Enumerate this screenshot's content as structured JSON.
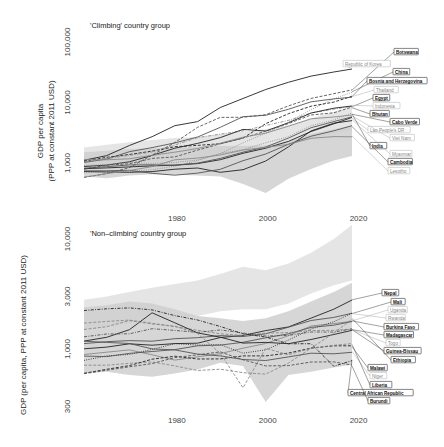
{
  "chart_data": [
    {
      "type": "line",
      "title": "'Climbing' country group",
      "xlabel": "",
      "ylabel": "GDP per capita\n(PPP at constant 2011 USD)",
      "ylabel_line1": "GDP per capita",
      "ylabel_line2": "(PPP at constant 2011 USD)",
      "yscale": "log",
      "ylim": [
        300,
        100000
      ],
      "xlim": [
        1960,
        2022
      ],
      "x_ticks": [
        1980,
        2000,
        2020
      ],
      "x_tick_labels": [
        "1980",
        "2000",
        "2020"
      ],
      "y_ticks": [
        1000,
        10000,
        100000
      ],
      "y_tick_labels": [
        "1,000",
        "10,000",
        "100,000"
      ],
      "grid": false,
      "legend": "direct labels at right end of lines",
      "x": [
        1960,
        1965,
        1970,
        1975,
        1980,
        1985,
        1990,
        1995,
        2000,
        2005,
        2010,
        2015,
        2019
      ],
      "bands": [
        {
          "name": "upper band",
          "lower": [
            900,
            950,
            1000,
            1050,
            1100,
            1200,
            1350,
            1500,
            1650,
            2000,
            2500,
            3000,
            3500
          ],
          "upper": [
            1800,
            2000,
            2200,
            2400,
            2600,
            2700,
            3000,
            3300,
            3600,
            4200,
            5500,
            7000,
            8500
          ]
        },
        {
          "name": "lower band",
          "lower": [
            600,
            560,
            620,
            650,
            640,
            620,
            600,
            450,
            320,
            550,
            800,
            1100,
            1300
          ],
          "upper": [
            1500,
            1600,
            1700,
            1750,
            1800,
            1850,
            1900,
            1900,
            1950,
            2300,
            3000,
            3600,
            4200
          ]
        }
      ],
      "series": [
        {
          "name": "Republic of Korea",
          "style": "solid",
          "values": [
            1100,
            1350,
            1900,
            2800,
            4000,
            5000,
            8000,
            12000,
            16000,
            22000,
            27000,
            32000,
            36000
          ]
        },
        {
          "name": "Botswana",
          "style": "dashed",
          "values": [
            560,
            650,
            850,
            1400,
            2200,
            3800,
            5500,
            5700,
            6500,
            9000,
            11500,
            13500,
            16000
          ]
        },
        {
          "name": "China",
          "style": "dotted",
          "values": [
            700,
            750,
            750,
            800,
            900,
            1100,
            1400,
            2100,
            3000,
            4600,
            7500,
            11500,
            15000
          ]
        },
        {
          "name": "Bosnia and Herzegovina",
          "style": "dashed",
          "values": [
            1100,
            1200,
            1400,
            1600,
            1800,
            2000,
            2100,
            2500,
            4600,
            6500,
            8500,
            10500,
            12500
          ]
        },
        {
          "name": "Thailand",
          "style": "solid",
          "values": [
            1000,
            1200,
            1500,
            1800,
            2200,
            2600,
            4000,
            5800,
            6000,
            8000,
            10000,
            11500,
            12500
          ]
        },
        {
          "name": "Egypt",
          "style": "dashdot",
          "values": [
            1000,
            1150,
            1300,
            1500,
            2000,
            2700,
            3100,
            3500,
            4200,
            5000,
            6500,
            7500,
            8500
          ]
        },
        {
          "name": "Indonesia",
          "style": "solid",
          "values": [
            900,
            950,
            1050,
            1300,
            1700,
            2100,
            2700,
            3700,
            3400,
            4500,
            6500,
            8000,
            9000
          ]
        },
        {
          "name": "Bhutan",
          "style": "dashed",
          "values": [
            800,
            900,
            1000,
            1150,
            1300,
            1600,
            2100,
            2600,
            3300,
            4600,
            6000,
            7000,
            8200
          ]
        },
        {
          "name": "Cabo Verde",
          "style": "solid",
          "values": [
            1100,
            1150,
            1200,
            1300,
            1500,
            1800,
            2100,
            2600,
            3200,
            4100,
            5200,
            5800,
            6400
          ]
        },
        {
          "name": "Lao People's DR",
          "style": "solid",
          "values": [
            800,
            820,
            850,
            880,
            900,
            950,
            1100,
            1400,
            1700,
            2200,
            3200,
            4300,
            5500
          ]
        },
        {
          "name": "Viet Nam",
          "style": "solid",
          "values": [
            850,
            870,
            900,
            930,
            950,
            1000,
            1150,
            1500,
            1900,
            2600,
            3700,
            4800,
            6000
          ]
        },
        {
          "name": "India",
          "style": "dotted",
          "values": [
            900,
            950,
            1000,
            1000,
            1000,
            1150,
            1400,
            1700,
            2100,
            2800,
            4000,
            5300,
            6500
          ]
        },
        {
          "name": "Myanmar",
          "style": "solid",
          "values": [
            700,
            700,
            720,
            740,
            780,
            800,
            700,
            800,
            1100,
            1800,
            3300,
            4600,
            5200
          ]
        },
        {
          "name": "Cambodia",
          "style": "solid",
          "values": [
            750,
            760,
            780,
            700,
            650,
            700,
            800,
            1100,
            1400,
            2000,
            2700,
            3300,
            4000
          ]
        },
        {
          "name": "Lesotho",
          "style": "solid",
          "values": [
            600,
            650,
            750,
            900,
            1100,
            1200,
            1400,
            1600,
            1800,
            2100,
            2500,
            2700,
            2800
          ]
        }
      ]
    },
    {
      "type": "line",
      "title": "'Non–climbing' country group",
      "xlabel": "",
      "ylabel": "GDP (per capita, PPP at constant 2011 USD)",
      "yscale": "log",
      "ylim": [
        200,
        14000
      ],
      "xlim": [
        1960,
        2022
      ],
      "x_ticks": [
        1980,
        2000,
        2020
      ],
      "x_tick_labels": [
        "1980",
        "2000",
        "2020"
      ],
      "y_ticks": [
        300,
        1000,
        3000,
        10000
      ],
      "y_tick_labels": [
        "300",
        "1,000",
        "3,000",
        "10,000"
      ],
      "grid": false,
      "legend": "direct labels at right end of lines",
      "x": [
        1960,
        1965,
        1970,
        1975,
        1980,
        1985,
        1990,
        1995,
        2000,
        2005,
        2010,
        2015,
        2019
      ],
      "bands": [
        {
          "name": "upper band",
          "lower": [
            1500,
            1600,
            1700,
            1800,
            1900,
            2000,
            2200,
            2300,
            2300,
            2600,
            3200,
            3800,
            4200
          ],
          "upper": [
            2800,
            3000,
            3300,
            3600,
            3900,
            4200,
            4800,
            5600,
            5200,
            6000,
            7500,
            10000,
            13500
          ]
        },
        {
          "name": "lower band",
          "lower": [
            600,
            620,
            580,
            560,
            600,
            650,
            750,
            700,
            330,
            580,
            620,
            680,
            720
          ],
          "upper": [
            2400,
            2500,
            2700,
            2600,
            2300,
            2000,
            1900,
            1800,
            1900,
            2200,
            2700,
            3300,
            4000
          ]
        }
      ],
      "series": [
        {
          "name": "Nepal",
          "style": "solid",
          "values": [
            1000,
            1050,
            1100,
            1100,
            1100,
            1150,
            1250,
            1350,
            1450,
            1600,
            1900,
            2300,
            2800
          ]
        },
        {
          "name": "Mali",
          "style": "solid",
          "values": [
            1100,
            1150,
            1200,
            1200,
            1250,
            1250,
            1300,
            1300,
            1400,
            1600,
            1800,
            1900,
            2100
          ]
        },
        {
          "name": "Uganda",
          "style": "solid",
          "values": [
            900,
            950,
            1000,
            900,
            800,
            850,
            900,
            1000,
            1100,
            1300,
            1600,
            1700,
            1800
          ]
        },
        {
          "name": "Rwanda",
          "style": "dotted",
          "values": [
            800,
            850,
            900,
            1000,
            1100,
            1100,
            1100,
            900,
            1000,
            1200,
            1500,
            1800,
            2100
          ]
        },
        {
          "name": "Burkina Faso",
          "style": "solid",
          "values": [
            850,
            870,
            900,
            950,
            1000,
            1050,
            1100,
            1150,
            1250,
            1400,
            1550,
            1650,
            1800
          ]
        },
        {
          "name": "Madagascar",
          "style": "dashed",
          "values": [
            1700,
            1750,
            1800,
            1700,
            1600,
            1500,
            1400,
            1350,
            1400,
            1400,
            1450,
            1450,
            1500
          ]
        },
        {
          "name": "Togo",
          "style": "solid",
          "values": [
            1200,
            1300,
            1500,
            2100,
            1700,
            1400,
            1300,
            1150,
            1150,
            1100,
            1200,
            1350,
            1500
          ]
        },
        {
          "name": "Guinea-Bissau",
          "style": "dashdot",
          "values": [
            1300,
            1350,
            1400,
            1500,
            1500,
            1400,
            1500,
            1400,
            1300,
            1350,
            1400,
            1450,
            1500
          ]
        },
        {
          "name": "Ethiopia",
          "style": "dashed",
          "values": [
            700,
            720,
            750,
            750,
            700,
            650,
            650,
            600,
            600,
            750,
            1000,
            1400,
            1900
          ]
        },
        {
          "name": "Malawi",
          "style": "dashed",
          "values": [
            600,
            650,
            700,
            800,
            850,
            800,
            800,
            850,
            850,
            900,
            1000,
            1050,
            1050
          ]
        },
        {
          "name": "Niger",
          "style": "solid",
          "values": [
            1200,
            1150,
            1100,
            1000,
            1000,
            900,
            850,
            800,
            800,
            850,
            900,
            900,
            950
          ]
        },
        {
          "name": "Liberia",
          "style": "dashed",
          "values": [
            1500,
            1600,
            1800,
            1700,
            1600,
            1400,
            900,
            450,
            1000,
            900,
            1000,
            1100,
            1100
          ]
        },
        {
          "name": "Central African Republic",
          "style": "dashdot",
          "values": [
            2200,
            2300,
            2400,
            2300,
            2000,
            1800,
            1600,
            1400,
            1300,
            1100,
            1100,
            700,
            800
          ]
        },
        {
          "name": "Burundi",
          "style": "dashed",
          "values": [
            600,
            650,
            700,
            750,
            850,
            900,
            950,
            800,
            700,
            700,
            750,
            750,
            700
          ]
        }
      ]
    }
  ],
  "colors": {
    "line_dark": "#222222",
    "line_mid": "#555555",
    "line_light": "#8a8a8a",
    "band_upper": "#e2e2e2",
    "band_lower": "#cfcfcf",
    "label_bold_border": "#333333",
    "label_light_border": "#999999"
  }
}
